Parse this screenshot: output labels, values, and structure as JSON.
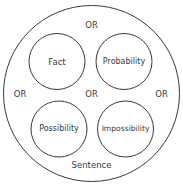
{
  "diagram": {
    "outer": {
      "label": "Sentence"
    },
    "circles": [
      {
        "label": "Fact"
      },
      {
        "label": "Probability"
      },
      {
        "label": "Possibility"
      },
      {
        "label": "Impossibility"
      }
    ],
    "connectors": {
      "top": "OR",
      "left": "OR",
      "center": "OR",
      "right": "OR"
    },
    "colors": {
      "stroke": "#3a3a3a",
      "text": "#3a3a3a",
      "background": "#ffffff"
    }
  }
}
